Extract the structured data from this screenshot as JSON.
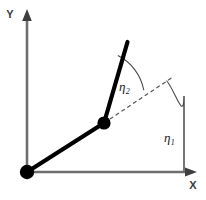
{
  "figure": {
    "type": "diagram",
    "background_color": "#ffffff",
    "width": 206,
    "height": 200
  },
  "axes": {
    "x": {
      "label": "X",
      "color": "#6e6e6e",
      "label_color": "#3a3a3a",
      "origin_px": [
        27,
        172
      ],
      "end_px": [
        195,
        172
      ],
      "arrow": "arrow-right"
    },
    "y": {
      "label": "Y",
      "color": "#6e6e6e",
      "label_color": "#3a3a3a",
      "origin_px": [
        27,
        172
      ],
      "end_px": [
        27,
        12
      ],
      "arrow": "arrow-up"
    }
  },
  "links": [
    {
      "name": "link-1",
      "from_px": [
        27,
        172
      ],
      "to_px": [
        104,
        123
      ],
      "color": "#000000",
      "width": 4.2
    },
    {
      "name": "link-2",
      "from_px": [
        104,
        123
      ],
      "to_px": [
        127,
        42
      ],
      "color": "#000000",
      "width": 4.2
    }
  ],
  "joints": [
    {
      "name": "base-joint",
      "center_px": [
        27,
        172
      ],
      "radius": 7.2,
      "color": "#000000"
    },
    {
      "name": "elbow-joint",
      "center_px": [
        104,
        123
      ],
      "radius": 6.6,
      "color": "#000000"
    }
  ],
  "reference_lines": [
    {
      "name": "link-1-extension",
      "style": "dashed",
      "from_px": [
        104,
        123
      ],
      "to_px": [
        173,
        77
      ],
      "color": "#555555",
      "dash": "4 3"
    },
    {
      "name": "x-axis-vertical-reference",
      "style": "solid",
      "from_px": [
        184,
        172
      ],
      "to_px": [
        184,
        95
      ],
      "color": "#6e6e6e"
    }
  ],
  "angles": [
    {
      "name": "eta-1",
      "symbol": "η",
      "subscript": "1",
      "label_px": [
        164,
        138
      ],
      "description": "angle of link 1 measured from the X axis",
      "arc_color": "#4a4a4a",
      "arc_from_px": [
        184,
        172
      ],
      "arc_to_px": [
        166,
        80
      ]
    },
    {
      "name": "eta-2",
      "symbol": "η",
      "subscript": "2",
      "label_px": [
        119,
        91
      ],
      "description": "angle of link 2 measured from the extension of link 1",
      "arc_color": "#4a4a4a",
      "arc_from_px": [
        118,
        56
      ],
      "arc_to_px": [
        143,
        90
      ]
    }
  ]
}
